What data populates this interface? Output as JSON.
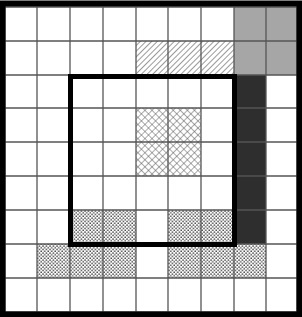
{
  "grid": {
    "columns": 9,
    "rows": 9,
    "col_lines": [
      5,
      37,
      70,
      103,
      136,
      168,
      201,
      234,
      266,
      297
    ],
    "row_lines": [
      7,
      41,
      75,
      108,
      142,
      176,
      210,
      244,
      278,
      312
    ],
    "line_color": "#555555",
    "border_color": "#000000"
  },
  "regions": [
    {
      "name": "gray-block",
      "pattern": "gray",
      "cells": [
        [
          7,
          0
        ],
        [
          8,
          0
        ],
        [
          7,
          1
        ],
        [
          8,
          1
        ]
      ]
    },
    {
      "name": "diagonal-hatch-block",
      "pattern": "diagonal",
      "cells": [
        [
          4,
          1
        ],
        [
          5,
          1
        ],
        [
          6,
          1
        ]
      ]
    },
    {
      "name": "dark-column",
      "pattern": "dark",
      "cells": [
        [
          7,
          2
        ],
        [
          7,
          3
        ],
        [
          7,
          4
        ],
        [
          7,
          5
        ],
        [
          7,
          6
        ]
      ]
    },
    {
      "name": "crosshatch-block",
      "pattern": "crosshatch",
      "cells": [
        [
          4,
          3
        ],
        [
          5,
          3
        ],
        [
          4,
          4
        ],
        [
          5,
          4
        ]
      ]
    },
    {
      "name": "dotted-row-6",
      "pattern": "dots",
      "cells": [
        [
          2,
          6
        ],
        [
          3,
          6
        ],
        [
          5,
          6
        ],
        [
          6,
          6
        ]
      ]
    },
    {
      "name": "dotted-row-7",
      "pattern": "dots",
      "cells": [
        [
          1,
          7
        ],
        [
          2,
          7
        ],
        [
          3,
          7
        ],
        [
          5,
          7
        ],
        [
          6,
          7
        ],
        [
          7,
          7
        ]
      ]
    }
  ],
  "thick_square": {
    "col_start": 2,
    "row_start": 2,
    "col_end": 7,
    "row_end": 7,
    "stroke": 5
  },
  "colors": {
    "gray": "#a6a6a6",
    "dark": "#2e2e2e",
    "pattern_ink": "#444444"
  }
}
